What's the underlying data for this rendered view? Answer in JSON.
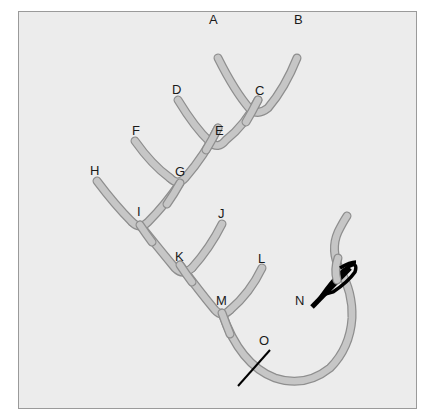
{
  "diagram": {
    "type": "stitch-diagram",
    "colors": {
      "background": "#ececec",
      "border": "#9a9a9a",
      "thread_fill": "#c4c4c4",
      "thread_outline": "#8e8e8e",
      "needle": "#000000"
    },
    "labels": {
      "A": "A",
      "B": "B",
      "C": "C",
      "D": "D",
      "E": "E",
      "F": "F",
      "G": "G",
      "H": "H",
      "I": "I",
      "J": "J",
      "K": "K",
      "L": "L",
      "M": "M",
      "N": "N",
      "O": "O"
    }
  }
}
